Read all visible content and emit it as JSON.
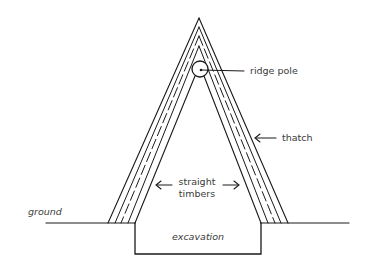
{
  "diagram": {
    "type": "cross-section",
    "labels": {
      "ridge_pole": "ridge pole",
      "thatch": "thatch",
      "straight_timbers_line1": "straight",
      "straight_timbers_line2": "timbers",
      "ground": "ground",
      "excavation": "excavation"
    },
    "colors": {
      "line": "#1a1a1a",
      "text": "#3a3a3a",
      "background": "#ffffff"
    }
  }
}
